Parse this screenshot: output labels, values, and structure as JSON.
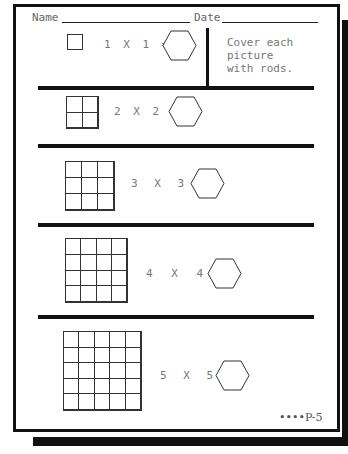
{
  "header": {
    "name_label": "Name",
    "date_label": "Date"
  },
  "instructions": "Cover each\npicture\nwith rods.",
  "problems": [
    {
      "size": 1,
      "expression": "1 X 1 =",
      "answer_shape": "hexagon"
    },
    {
      "size": 2,
      "expression": "2 X 2 =",
      "answer_shape": "hexagon"
    },
    {
      "size": 3,
      "expression": "3 X 3 =",
      "answer_shape": "hexagon"
    },
    {
      "size": 4,
      "expression": "4 X 4 =",
      "answer_shape": "hexagon"
    },
    {
      "size": 5,
      "expression": "5 X 5 =",
      "answer_shape": "hexagon"
    }
  ],
  "footer": {
    "page_label": "••••P-5"
  }
}
